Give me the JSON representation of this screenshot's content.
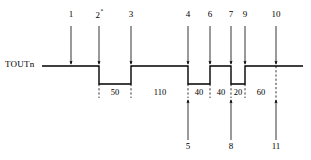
{
  "figure": {
    "type": "timing-diagram",
    "signal_label": "TOUTn",
    "background_color": "#ffffff",
    "line_color": "#000000"
  },
  "signal": {
    "name": "TOUTn",
    "high_level_y": 66,
    "low_level_y": 84,
    "start_x": 42,
    "end_x": 303,
    "segments": [
      {
        "level": "high",
        "x_start": 42,
        "x_end": 99
      },
      {
        "level": "low",
        "x_start": 99,
        "x_end": 131
      },
      {
        "level": "high",
        "x_start": 131,
        "x_end": 188
      },
      {
        "level": "low",
        "x_start": 188,
        "x_end": 210
      },
      {
        "level": "high",
        "x_start": 210,
        "x_end": 231
      },
      {
        "level": "low",
        "x_start": 231,
        "x_end": 245
      },
      {
        "level": "high",
        "x_start": 245,
        "x_end": 303
      }
    ]
  },
  "event_markers_top": [
    {
      "id": "1",
      "label": "1",
      "superscript": "",
      "x": 71,
      "arrow": "down"
    },
    {
      "id": "2",
      "label": "2",
      "superscript": "*",
      "x": 99,
      "arrow": "down"
    },
    {
      "id": "3",
      "label": "3",
      "superscript": "",
      "x": 131,
      "arrow": "down"
    },
    {
      "id": "4",
      "label": "4",
      "superscript": "",
      "x": 188,
      "arrow": "down"
    },
    {
      "id": "6",
      "label": "6",
      "superscript": "",
      "x": 210,
      "arrow": "down"
    },
    {
      "id": "7",
      "label": "7",
      "superscript": "",
      "x": 231,
      "arrow": "down"
    },
    {
      "id": "9",
      "label": "9",
      "superscript": "",
      "x": 245,
      "arrow": "down"
    },
    {
      "id": "10",
      "label": "10",
      "superscript": "",
      "x": 276,
      "arrow": "down"
    }
  ],
  "event_markers_bottom": [
    {
      "id": "5",
      "label": "5",
      "x": 188,
      "arrow": "up"
    },
    {
      "id": "8",
      "label": "8",
      "x": 231,
      "arrow": "up"
    },
    {
      "id": "11",
      "label": "11",
      "x": 276,
      "arrow": "up"
    }
  ],
  "durations": [
    {
      "value": "50",
      "x_center": 115,
      "x_start": 99,
      "x_end": 131
    },
    {
      "value": "110",
      "x_center": 160,
      "x_start": 131,
      "x_end": 188
    },
    {
      "value": "40",
      "x_center": 199,
      "x_start": 188,
      "x_end": 210
    },
    {
      "value": "40",
      "x_center": 221,
      "x_start": 210,
      "x_end": 231
    },
    {
      "value": "20",
      "x_center": 238,
      "x_start": 231,
      "x_end": 245
    },
    {
      "value": "60",
      "x_center": 261,
      "x_start": 245,
      "x_end": 276
    }
  ],
  "tick_positions": [
    99,
    131,
    188,
    210,
    231,
    245,
    276
  ],
  "axis": {
    "label_row_top_y": 16,
    "label_row_bottom_y": 148,
    "duration_label_y": 92
  }
}
